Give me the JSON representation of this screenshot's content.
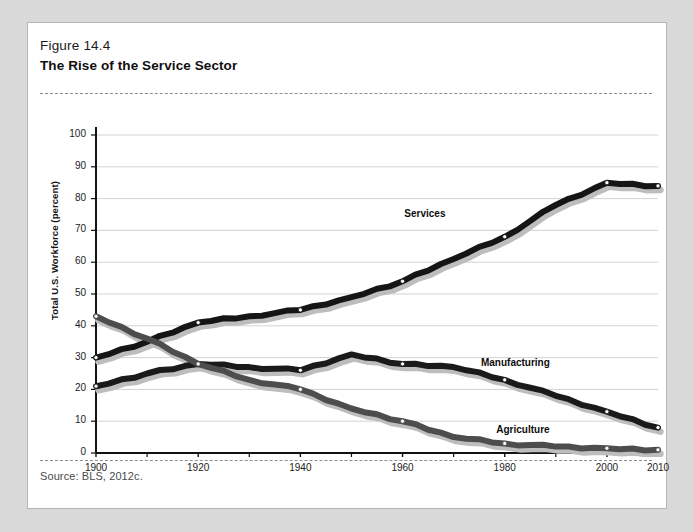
{
  "figure": {
    "number": "Figure 14.4",
    "title": "The Rise of the Service Sector",
    "source": "Source: BLS, 2012c."
  },
  "chart_data": {
    "type": "line",
    "title": "The Rise of the Service Sector",
    "xlabel": "",
    "ylabel": "Total U.S. Workforce (percent)",
    "xlim": [
      1900,
      2010
    ],
    "ylim": [
      0,
      100
    ],
    "grid": true,
    "legend_position": "inline-labels",
    "x_ticks": [
      1900,
      1920,
      1940,
      1960,
      1980,
      2000,
      2010
    ],
    "x_minor_ticks": [
      1910,
      1930,
      1950,
      1970,
      1990
    ],
    "y_ticks": [
      0,
      10,
      20,
      30,
      40,
      50,
      60,
      70,
      80,
      90,
      100
    ],
    "x": [
      1900,
      1910,
      1920,
      1930,
      1940,
      1950,
      1960,
      1970,
      1980,
      1990,
      2000,
      2010
    ],
    "series": [
      {
        "name": "Services",
        "color": "#151515",
        "values": [
          30,
          35,
          41,
          43,
          45,
          49,
          54,
          61,
          68,
          78,
          85,
          84
        ]
      },
      {
        "name": "Manufacturing",
        "color": "#1a1a1a",
        "values": [
          21,
          25,
          28,
          27,
          26,
          31,
          28,
          27,
          23,
          18,
          13,
          8
        ]
      },
      {
        "name": "Agriculture",
        "color": "#4d4d4d",
        "values": [
          43,
          36,
          28,
          23,
          20,
          14,
          10,
          5,
          3,
          2,
          1.5,
          1
        ]
      }
    ],
    "annotations": [
      {
        "text": "Services",
        "x": 1967,
        "y": 75
      },
      {
        "text": "Manufacturing",
        "x": 1982,
        "y": 28
      },
      {
        "text": "Agriculture",
        "x": 1985,
        "y": 7
      }
    ]
  }
}
